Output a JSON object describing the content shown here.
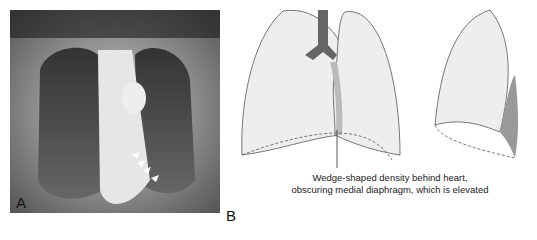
{
  "figure": {
    "panel_a": {
      "label": "A",
      "description": "Frontal chest radiograph with arrowheads marking a density behind the heart"
    },
    "panel_b": {
      "label": "B",
      "description": "Schematic of lungs, frontal and lateral views"
    },
    "annotation": {
      "line1": "Wedge-shaped density behind heart,",
      "line2": "obscuring medial diaphragm, which is elevated"
    },
    "caption_partial": "(caption text cut off at bottom edge)"
  }
}
